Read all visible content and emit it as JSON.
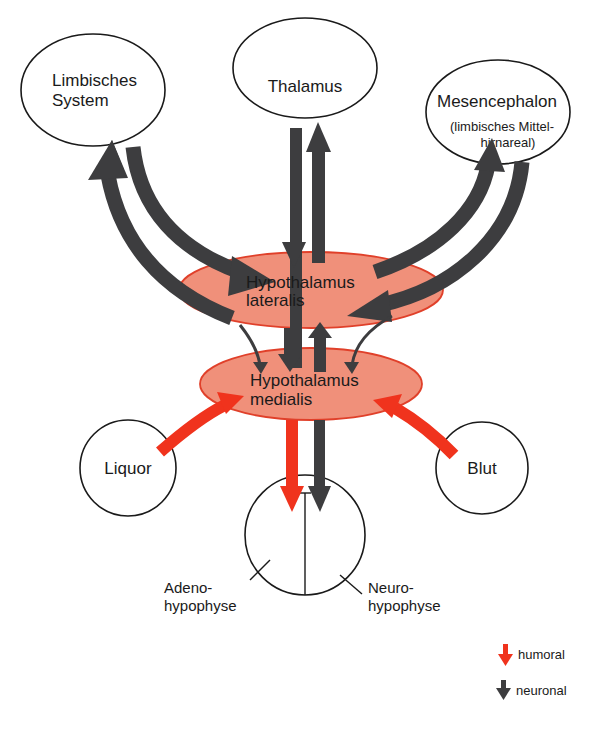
{
  "diagram": {
    "nodes": {
      "limbic": {
        "line1": "Limbisches",
        "line2": "System"
      },
      "thalamus": {
        "label": "Thalamus"
      },
      "mesencephalon": {
        "line1": "Mesencephalon",
        "line2": "(limbisches Mittel-",
        "line3": "hirnareal)"
      },
      "hypo_lateralis": {
        "line1": "Hypothalamus",
        "line2": "lateralis"
      },
      "hypo_medialis": {
        "line1": "Hypothalamus",
        "line2": "medialis"
      },
      "liquor": {
        "label": "Liquor"
      },
      "blut": {
        "label": "Blut"
      },
      "adeno": {
        "line1": "Adeno-",
        "line2": "hypophyse"
      },
      "neuro": {
        "line1": "Neuro-",
        "line2": "hypophyse"
      }
    },
    "edges": [
      {
        "from": "Hypothalamus lateralis",
        "to": "Limbisches System",
        "type": "neuronal"
      },
      {
        "from": "Limbisches System",
        "to": "Hypothalamus lateralis",
        "type": "neuronal"
      },
      {
        "from": "Thalamus",
        "to": "Hypothalamus lateralis",
        "type": "neuronal"
      },
      {
        "from": "Hypothalamus lateralis",
        "to": "Thalamus",
        "type": "neuronal"
      },
      {
        "from": "Hypothalamus lateralis",
        "to": "Mesencephalon",
        "type": "neuronal"
      },
      {
        "from": "Mesencephalon",
        "to": "Hypothalamus lateralis",
        "type": "neuronal"
      },
      {
        "from": "Limbisches System",
        "to": "Hypothalamus medialis",
        "type": "neuronal"
      },
      {
        "from": "Hypothalamus lateralis",
        "to": "Hypothalamus medialis",
        "type": "neuronal"
      },
      {
        "from": "Hypothalamus medialis",
        "to": "Hypothalamus lateralis",
        "type": "neuronal"
      },
      {
        "from": "Mesencephalon",
        "to": "Hypothalamus medialis",
        "type": "neuronal"
      },
      {
        "from": "Liquor",
        "to": "Hypothalamus medialis",
        "type": "humoral"
      },
      {
        "from": "Blut",
        "to": "Hypothalamus medialis",
        "type": "humoral"
      },
      {
        "from": "Hypothalamus medialis",
        "to": "Adenohypophyse",
        "type": "humoral"
      },
      {
        "from": "Hypothalamus medialis",
        "to": "Neurohypophyse",
        "type": "neuronal"
      }
    ],
    "legend": {
      "humoral": {
        "label": "humoral",
        "color": "#f0331d"
      },
      "neuronal": {
        "label": "neuronal",
        "color": "#3d3d3f"
      }
    },
    "colors": {
      "hypothalamus_fill": "#f0907a",
      "hypothalamus_stroke": "#e0402a",
      "humoral": "#f0331d",
      "neuronal": "#3d3d3f"
    }
  }
}
